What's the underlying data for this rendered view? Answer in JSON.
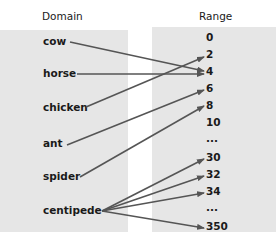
{
  "domain_header": "Domain",
  "range_header": "Range",
  "domain": [
    "cow",
    "horse",
    "chicken",
    "ant",
    "spider",
    "centipede"
  ],
  "range": [
    "0",
    "2",
    "4",
    "6",
    "8",
    "10",
    "...",
    "30",
    "32",
    "34",
    "...",
    "350"
  ],
  "mappings": [
    {
      "from": "cow",
      "to": "4"
    },
    {
      "from": "horse",
      "to": "4"
    },
    {
      "from": "chicken",
      "to": "2"
    },
    {
      "from": "ant",
      "to": "6"
    },
    {
      "from": "spider",
      "to": "8"
    },
    {
      "from": "centipede",
      "to": "30"
    },
    {
      "from": "centipede",
      "to": "32"
    },
    {
      "from": "centipede",
      "to": "34"
    },
    {
      "from": "centipede",
      "to": "350"
    }
  ],
  "colors": {
    "box": "#e6e6e6",
    "arrow": "#555555",
    "text": "#1a1a1a"
  }
}
